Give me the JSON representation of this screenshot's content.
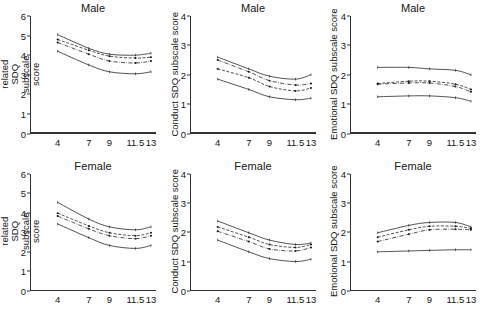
{
  "figure": {
    "rows": [
      "Male",
      "Female"
    ],
    "x_tick_labels": [
      "4",
      "7",
      "9",
      "11.5",
      "13"
    ],
    "series_names": [
      "upper-ci",
      "series-b",
      "series-c",
      "lower-ci"
    ]
  },
  "panels": [
    {
      "id": "adhd-male",
      "title": "Male",
      "ylabel": "ADHD-related SDQ subscale score",
      "yticks": [
        "0",
        "1",
        "2",
        "3",
        "4",
        "5",
        "6"
      ]
    },
    {
      "id": "conduct-male",
      "title": "Male",
      "ylabel": "Conduct SDQ subscale score",
      "yticks": [
        "0",
        "1",
        "2",
        "3",
        "4"
      ]
    },
    {
      "id": "emotional-male",
      "title": "Male",
      "ylabel": "Emotional SDQ subscale score",
      "yticks": [
        "0",
        "1",
        "2",
        "3",
        "4"
      ]
    },
    {
      "id": "adhd-female",
      "title": "Female",
      "ylabel": "ADHD-related SDQ subscale score",
      "yticks": [
        "0",
        "1",
        "2",
        "3",
        "4",
        "5",
        "6"
      ]
    },
    {
      "id": "conduct-female",
      "title": "Female",
      "ylabel": "Conduct SDQ subscale score",
      "yticks": [
        "0",
        "1",
        "2",
        "3",
        "4"
      ]
    },
    {
      "id": "emotional-female",
      "title": "Female",
      "ylabel": "Emotional SDQ subscale score",
      "yticks": [
        "0",
        "1",
        "2",
        "3",
        "4"
      ]
    }
  ],
  "chart_data": [
    {
      "type": "line",
      "id": "adhd-male",
      "title": "Male",
      "xlabel": "",
      "ylabel": "ADHD-related SDQ subscale score",
      "x": [
        4,
        7,
        9,
        11.5,
        13
      ],
      "xtick_labels": [
        "4",
        "7",
        "9",
        "11.5",
        "13"
      ],
      "ylim": [
        0,
        6
      ],
      "ytick_values": [
        0,
        1,
        2,
        3,
        4,
        5,
        6
      ],
      "grid": false,
      "legend": "none",
      "series": [
        {
          "name": "upper-ci",
          "style": "solid",
          "marker": "none",
          "values": [
            5.05,
            4.35,
            4.05,
            4.0,
            4.1
          ]
        },
        {
          "name": "series-b",
          "style": "dashed",
          "marker": "dot",
          "values": [
            4.8,
            4.25,
            3.95,
            3.85,
            3.9
          ]
        },
        {
          "name": "series-c",
          "style": "dash-dot",
          "marker": "dot",
          "values": [
            4.65,
            4.05,
            3.7,
            3.6,
            3.7
          ]
        },
        {
          "name": "lower-ci",
          "style": "solid",
          "marker": "none",
          "values": [
            4.2,
            3.5,
            3.15,
            3.05,
            3.15
          ]
        }
      ]
    },
    {
      "type": "line",
      "id": "conduct-male",
      "title": "Male",
      "xlabel": "",
      "ylabel": "Conduct SDQ subscale score",
      "x": [
        4,
        7,
        9,
        11.5,
        13
      ],
      "xtick_labels": [
        "4",
        "7",
        "9",
        "11.5",
        "13"
      ],
      "ylim": [
        0,
        4
      ],
      "ytick_values": [
        0,
        1,
        2,
        3,
        4
      ],
      "grid": false,
      "legend": "none",
      "series": [
        {
          "name": "upper-ci",
          "style": "solid",
          "marker": "none",
          "values": [
            2.6,
            2.2,
            1.95,
            1.85,
            2.0
          ]
        },
        {
          "name": "series-b",
          "style": "dash-dot",
          "marker": "dot",
          "values": [
            2.5,
            2.1,
            1.8,
            1.65,
            1.7
          ]
        },
        {
          "name": "series-c",
          "style": "dashed",
          "marker": "dot",
          "values": [
            2.2,
            1.9,
            1.6,
            1.45,
            1.55
          ]
        },
        {
          "name": "lower-ci",
          "style": "solid",
          "marker": "none",
          "values": [
            1.85,
            1.5,
            1.25,
            1.15,
            1.2
          ]
        }
      ]
    },
    {
      "type": "line",
      "id": "emotional-male",
      "title": "Male",
      "xlabel": "",
      "ylabel": "Emotional SDQ subscale score",
      "x": [
        4,
        7,
        9,
        11.5,
        13
      ],
      "xtick_labels": [
        "4",
        "7",
        "9",
        "11.5",
        "13"
      ],
      "ylim": [
        0,
        4
      ],
      "ytick_values": [
        0,
        1,
        2,
        3,
        4
      ],
      "grid": false,
      "legend": "none",
      "series": [
        {
          "name": "upper-ci",
          "style": "solid",
          "marker": "none",
          "values": [
            2.25,
            2.25,
            2.2,
            2.15,
            2.0
          ]
        },
        {
          "name": "series-b",
          "style": "dashed",
          "marker": "dot",
          "values": [
            1.7,
            1.78,
            1.78,
            1.68,
            1.5
          ]
        },
        {
          "name": "series-c",
          "style": "dash-dot",
          "marker": "dot",
          "values": [
            1.68,
            1.72,
            1.72,
            1.6,
            1.42
          ]
        },
        {
          "name": "lower-ci",
          "style": "solid",
          "marker": "none",
          "values": [
            1.25,
            1.28,
            1.28,
            1.22,
            1.1
          ]
        }
      ]
    },
    {
      "type": "line",
      "id": "adhd-female",
      "title": "Female",
      "xlabel": "",
      "ylabel": "ADHD-related SDQ subscale score",
      "x": [
        4,
        7,
        9,
        11.5,
        13
      ],
      "xtick_labels": [
        "4",
        "7",
        "9",
        "11.5",
        "13"
      ],
      "ylim": [
        0,
        6
      ],
      "ytick_values": [
        0,
        1,
        2,
        3,
        4,
        5,
        6
      ],
      "grid": false,
      "legend": "none",
      "series": [
        {
          "name": "upper-ci",
          "style": "solid",
          "marker": "none",
          "values": [
            4.55,
            3.7,
            3.3,
            3.15,
            3.3
          ]
        },
        {
          "name": "series-b",
          "style": "dashed",
          "marker": "dot",
          "values": [
            4.0,
            3.35,
            3.0,
            2.85,
            3.0
          ]
        },
        {
          "name": "series-c",
          "style": "dash-dot",
          "marker": "dot",
          "values": [
            3.85,
            3.2,
            2.85,
            2.7,
            2.85
          ]
        },
        {
          "name": "lower-ci",
          "style": "solid",
          "marker": "none",
          "values": [
            3.45,
            2.75,
            2.35,
            2.2,
            2.35
          ]
        }
      ]
    },
    {
      "type": "line",
      "id": "conduct-female",
      "title": "Female",
      "xlabel": "",
      "ylabel": "Conduct SDQ subscale score",
      "x": [
        4,
        7,
        9,
        11.5,
        13
      ],
      "xtick_labels": [
        "4",
        "7",
        "9",
        "11.5",
        "13"
      ],
      "ylim": [
        0,
        4
      ],
      "ytick_values": [
        0,
        1,
        2,
        3,
        4
      ],
      "grid": false,
      "legend": "none",
      "series": [
        {
          "name": "upper-ci",
          "style": "solid",
          "marker": "none",
          "values": [
            2.4,
            2.0,
            1.75,
            1.6,
            1.65
          ]
        },
        {
          "name": "series-b",
          "style": "dashed",
          "marker": "dot",
          "values": [
            2.2,
            1.85,
            1.6,
            1.5,
            1.6
          ]
        },
        {
          "name": "series-c",
          "style": "dash-dot",
          "marker": "dot",
          "values": [
            2.05,
            1.7,
            1.45,
            1.38,
            1.5
          ]
        },
        {
          "name": "lower-ci",
          "style": "solid",
          "marker": "none",
          "values": [
            1.75,
            1.35,
            1.12,
            1.02,
            1.1
          ]
        }
      ]
    },
    {
      "type": "line",
      "id": "emotional-female",
      "title": "Female",
      "xlabel": "",
      "ylabel": "Emotional SDQ subscale score",
      "x": [
        4,
        7,
        9,
        11.5,
        13
      ],
      "xtick_labels": [
        "4",
        "7",
        "9",
        "11.5",
        "13"
      ],
      "ylim": [
        0,
        4
      ],
      "ytick_values": [
        0,
        1,
        2,
        3,
        4
      ],
      "grid": false,
      "legend": "none",
      "series": [
        {
          "name": "upper-ci",
          "style": "solid",
          "marker": "none",
          "values": [
            2.0,
            2.25,
            2.35,
            2.35,
            2.2
          ]
        },
        {
          "name": "series-b",
          "style": "dashed",
          "marker": "dot",
          "values": [
            1.85,
            2.1,
            2.22,
            2.22,
            2.15
          ]
        },
        {
          "name": "series-c",
          "style": "dash-dot",
          "marker": "dot",
          "values": [
            1.7,
            1.95,
            2.1,
            2.12,
            2.1
          ]
        },
        {
          "name": "lower-ci",
          "style": "solid",
          "marker": "none",
          "values": [
            1.35,
            1.38,
            1.4,
            1.42,
            1.42
          ]
        }
      ]
    }
  ],
  "colors": {
    "axis": "#333333",
    "line": "#1a1a1a",
    "text": "#141414",
    "background": "#ffffff"
  }
}
